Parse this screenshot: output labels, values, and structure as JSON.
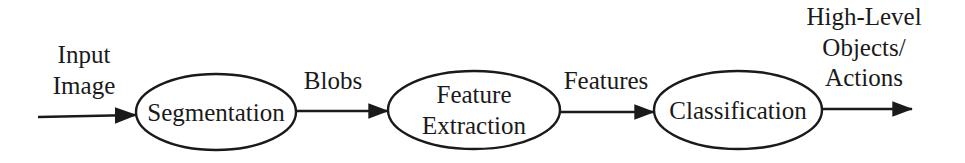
{
  "diagram": {
    "type": "flow-diagram",
    "background_color": "#ffffff",
    "stroke_color": "#1a1a1a",
    "text_color": "#1a1a1a",
    "nodes": [
      {
        "id": "segmentation",
        "shape": "ellipse",
        "lines": [
          "Segmentation"
        ],
        "cx": 216,
        "cy": 112,
        "rx": 80,
        "ry": 38
      },
      {
        "id": "feature-extraction",
        "shape": "ellipse",
        "lines": [
          "Feature",
          "Extraction"
        ],
        "cx": 474,
        "cy": 110,
        "rx": 86,
        "ry": 39
      },
      {
        "id": "classification",
        "shape": "ellipse",
        "lines": [
          "Classification"
        ],
        "cx": 738,
        "cy": 110,
        "rx": 84,
        "ry": 39
      }
    ],
    "edges": [
      {
        "id": "input-to-segmentation",
        "label_lines": [
          "Input",
          "Image"
        ],
        "label_cx": 84,
        "label_top": 40,
        "x1": 38,
        "y1": 117,
        "x2": 138,
        "y2": 115,
        "arrowhead": "end"
      },
      {
        "id": "segmentation-to-feature-extraction",
        "label_lines": [
          "Blobs"
        ],
        "label_cx": 333,
        "label_top": 66,
        "x1": 296,
        "y1": 111,
        "x2": 390,
        "y2": 111,
        "arrowhead": "end"
      },
      {
        "id": "feature-extraction-to-classification",
        "label_lines": [
          "Features"
        ],
        "label_cx": 606,
        "label_top": 66,
        "x1": 560,
        "y1": 112,
        "x2": 656,
        "y2": 112,
        "arrowhead": "end"
      },
      {
        "id": "classification-to-output",
        "label_lines": [
          "High-Level",
          "Objects/",
          "Actions"
        ],
        "label_cx": 864,
        "label_top": 2,
        "x1": 822,
        "y1": 109,
        "x2": 915,
        "y2": 109,
        "arrowhead": "end"
      }
    ]
  }
}
